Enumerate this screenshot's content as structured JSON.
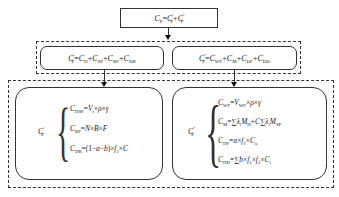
{
  "diagram": {
    "top": {
      "formula": "C_P = C'_P + C''_P",
      "lhs": "C",
      "lhs_sub": "P",
      "eq": "=",
      "t1": "C",
      "t1_sup": "'",
      "t1_sub": "P",
      "plus": "+",
      "t2": "C",
      "t2_sup": "''",
      "t2_sub": "P"
    },
    "middle_left": {
      "formula": "C'_P = C_H + C_SP + C_BF + C_DR",
      "lhs": "C",
      "lhs_sup": "'",
      "lhs_sub": "P",
      "terms": [
        {
          "sym": "C",
          "sub": "H"
        },
        {
          "sym": "C",
          "sub": "SP"
        },
        {
          "sym": "C",
          "sub": "BF"
        },
        {
          "sym": "C",
          "sub": "DR"
        }
      ]
    },
    "middle_right": {
      "formula": "C''_P = C_WF + C_M + C_DF + C_DD",
      "lhs": "C",
      "lhs_sup": "''",
      "lhs_sub": "P",
      "terms": [
        {
          "sym": "C",
          "sub": "WF"
        },
        {
          "sym": "C",
          "sub": "M"
        },
        {
          "sym": "C",
          "sub": "DF"
        },
        {
          "sym": "C",
          "sub": "DD"
        }
      ]
    },
    "bottom_left": {
      "label": "C",
      "label_sup": "'",
      "label_sub": "P",
      "equations": [
        {
          "lhs": "C",
          "lhs_sub": "HSP",
          "rhs": "=V_t × ρ × γ"
        },
        {
          "lhs": "C",
          "lhs_sub": "BF",
          "rhs": "=N × B × F"
        },
        {
          "lhs": "C",
          "lhs_sub": "DR",
          "rhs": "=(1−a−b) × f_1 × C"
        }
      ]
    },
    "bottom_right": {
      "label": "C",
      "label_sup": "''",
      "label_sub": "P",
      "equations": [
        {
          "lhs": "C",
          "lhs_sub": "WF",
          "rhs": "=V_WF × ρ × γ"
        },
        {
          "lhs": "C",
          "lhs_sub": "M",
          "rhs": "=∑λ_i M_H + C∑λ_i M_SP"
        },
        {
          "lhs": "C",
          "lhs_sub": "DF",
          "rhs": "=α × f_1 × C_a"
        },
        {
          "lhs": "C",
          "lhs_sub": "DD",
          "rhs": "=∑b × f_1 × f_2 × C_i"
        }
      ]
    },
    "symbols": {
      "eq": "=",
      "plus": "+",
      "times": "×",
      "sum": "∑",
      "rho": "ρ",
      "gamma": "γ",
      "lambda": "λ",
      "alpha": "α",
      "minus": "−",
      "brace": "{"
    }
  }
}
